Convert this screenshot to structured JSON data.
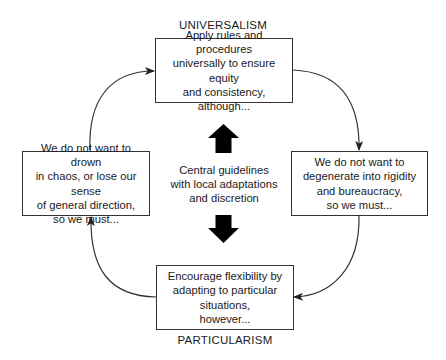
{
  "diagram": {
    "top_label": "UNIVERSALISM",
    "bottom_label": "PARTICULARISM",
    "boxes": {
      "top": "Apply rules and procedures\nuniversally to ensure equity\nand consistency,\nalthough...",
      "right": "We do not want to\ndegenerate into rigidity\nand bureaucracy,\nso we must...",
      "bottom": "Encourage flexibility by\nadapting to particular\nsituations,\nhowever...",
      "left": "We do not want to drown\nin chaos, or lose our sense\nof general direction,\nso we must..."
    },
    "center": "Central guidelines\nwith local adaptations\nand discretion",
    "icons": {
      "center_up": "thick-up-arrow-icon",
      "center_down": "thick-down-arrow-icon",
      "cycle": "curved-arrow-icon"
    },
    "colors": {
      "line": "#333333",
      "text": "#1a1a1a",
      "arrow_fill": "#000000",
      "background": "#ffffff"
    }
  }
}
